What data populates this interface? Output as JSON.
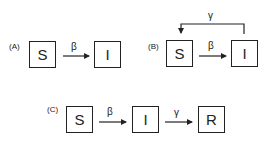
{
  "panels": {
    "A": {
      "label": "(A)",
      "nodes": {
        "S": "S",
        "I": "I"
      },
      "rates": {
        "S_to_I": "β"
      }
    },
    "B": {
      "label": "(B)",
      "nodes": {
        "S": "S",
        "I": "I"
      },
      "rates": {
        "S_to_I": "β",
        "I_to_S": "γ"
      }
    },
    "C": {
      "label": "(C)",
      "nodes": {
        "S": "S",
        "I": "I",
        "R": "R"
      },
      "rates": {
        "S_to_I": "β",
        "I_to_R": "γ"
      }
    }
  },
  "colors": {
    "stroke": "#222222",
    "background": "#ffffff"
  }
}
